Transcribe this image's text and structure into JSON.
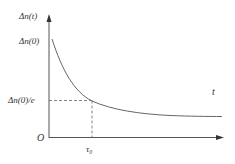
{
  "diagram": {
    "type": "exponential-decay-plot",
    "y_axis_label": "Δn(t)",
    "x_axis_label": "t",
    "origin_label": "O",
    "y_tick_top": "Δn(0)",
    "y_tick_mid": "Δn(0)/e",
    "x_tick": "τ₀",
    "colors": {
      "axis": "#555555",
      "curve": "#666666",
      "text": "#333333"
    }
  }
}
